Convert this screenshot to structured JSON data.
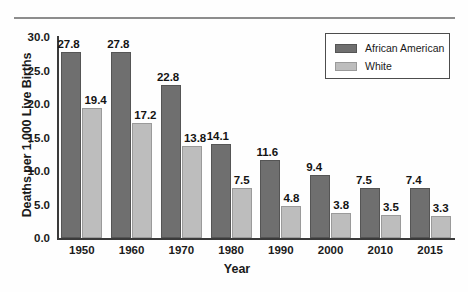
{
  "chart_data": {
    "type": "bar",
    "title": "",
    "xlabel": "Year",
    "ylabel": "Deaths per 1,000 Live Births",
    "categories": [
      "1950",
      "1960",
      "1970",
      "1980",
      "1990",
      "2000",
      "2010",
      "2015"
    ],
    "series": [
      {
        "name": "African American",
        "color": "#6f6f6f",
        "values": [
          27.8,
          27.8,
          22.8,
          14.1,
          11.6,
          9.4,
          7.5,
          7.4
        ]
      },
      {
        "name": "White",
        "color": "#bdbdbd",
        "values": [
          19.4,
          17.2,
          13.8,
          7.5,
          4.8,
          3.8,
          3.5,
          3.3
        ]
      }
    ],
    "ylim": [
      0.0,
      30.0
    ],
    "ytick_labels": [
      "0.0",
      "5.0",
      "10.0",
      "15.0",
      "20.0",
      "25.0",
      "30.0"
    ],
    "ytick_values": [
      0,
      5,
      10,
      15,
      20,
      25,
      30
    ],
    "grid": false,
    "legend_position": "top-right",
    "value_labels": {
      "african_american": [
        "27.8",
        "27.8",
        "22.8",
        "14.1",
        "11.6",
        "9.4",
        "7.5",
        "7.4"
      ],
      "white": [
        "19.4",
        "17.2",
        "13.8",
        "7.5",
        "4.8",
        "3.8",
        "3.5",
        "3.3"
      ]
    }
  },
  "legend": {
    "entries": [
      {
        "label": "African American",
        "color": "#6f6f6f"
      },
      {
        "label": "White",
        "color": "#bdbdbd"
      }
    ]
  },
  "axis": {
    "y_title": "Deaths per 1,000 Live Births",
    "x_title": "Year"
  }
}
